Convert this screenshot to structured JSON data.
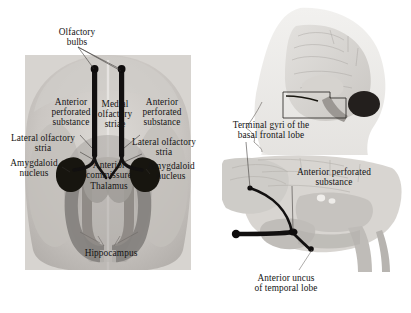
{
  "figure": {
    "type": "anatomical-diagram",
    "background_color": "#ffffff"
  },
  "left_panel": {
    "name": "basal-brain-photograph",
    "description": "Inferior (basal) view of the human brain showing the olfactory apparatus",
    "labels": [
      {
        "id": "olfactory-bulbs",
        "text": "Olfactory\nbulbs",
        "x": 46,
        "y": 27,
        "w": 62,
        "align": "center"
      },
      {
        "id": "anterior-perforated-left",
        "text": "Anterior\nperforated\nsubstance",
        "x": 40,
        "y": 97,
        "w": 62,
        "align": "center"
      },
      {
        "id": "medial-olfactory-striae",
        "text": "Medial\nolfactory\nstriae",
        "x": 92,
        "y": 99,
        "w": 46,
        "align": "center"
      },
      {
        "id": "anterior-perforated-right",
        "text": "Anterior\nperforated\nsubstance",
        "x": 131,
        "y": 97,
        "w": 62,
        "align": "center"
      },
      {
        "id": "lateral-olfactory-stria-left",
        "text": "Lateral olfactory\nstria",
        "x": 5,
        "y": 133,
        "w": 76,
        "align": "center"
      },
      {
        "id": "lateral-olfactory-stria-right",
        "text": "Lateral olfactory\nstria",
        "x": 126,
        "y": 137,
        "w": 76,
        "align": "center"
      },
      {
        "id": "amygdaloid-nucleus-left",
        "text": "Amygdaloid\nnucleus",
        "x": 4,
        "y": 158,
        "w": 60,
        "align": "center"
      },
      {
        "id": "amygdaloid-nucleus-right",
        "text": "Amygdaloid\nnucleus",
        "x": 141,
        "y": 161,
        "w": 60,
        "align": "center"
      },
      {
        "id": "anterior-commissure",
        "text": "Anterior\ncommissure",
        "x": 78,
        "y": 160,
        "w": 62,
        "align": "center"
      },
      {
        "id": "thalamus",
        "text": "Thalamus",
        "x": 80,
        "y": 181,
        "w": 58,
        "align": "center"
      },
      {
        "id": "hippocampus",
        "text": "Hippocampus",
        "x": 74,
        "y": 248,
        "w": 74,
        "align": "center"
      }
    ]
  },
  "right_panel": {
    "name": "sagittal-brain-views",
    "description": "Head silhouette with midsagittal brain and magnified medial basal view",
    "labels": [
      {
        "id": "terminal-gyri",
        "text": "Terminal gyri of the\nbasal frontal lobe",
        "x": 221,
        "y": 120,
        "w": 100,
        "align": "center"
      },
      {
        "id": "anterior-perforated-sag",
        "text": "Anterior perforated\nsubstance",
        "x": 285,
        "y": 167,
        "w": 98,
        "align": "center"
      },
      {
        "id": "anterior-uncus",
        "text": "Anterior uncus\nof temporal lobe",
        "x": 238,
        "y": 273,
        "w": 96,
        "align": "center"
      }
    ]
  },
  "colors": {
    "brain_light": "#d2cfcb",
    "brain_mid": "#b8b4b0",
    "brain_dark": "#8d8884",
    "tract_black": "#141210",
    "hippocampus_gray": "#8b8884",
    "label_text": "#141414",
    "leader_line": "#33302e"
  }
}
